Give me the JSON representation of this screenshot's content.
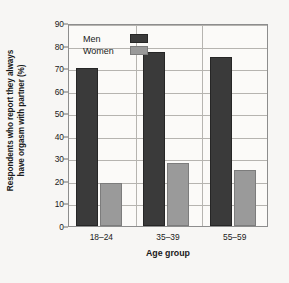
{
  "chart_data": {
    "type": "bar",
    "title": "",
    "subtitle": "",
    "xlabel": "Age group",
    "ylabel_line1": "Respondents who report they always",
    "ylabel_line2": "have orgasm with partner (%)",
    "ylabel": "Respondents who report they always have orgasm with partner (%)",
    "categories": [
      "18–24",
      "35–39",
      "55–59"
    ],
    "series": [
      {
        "name": "Men",
        "values": [
          70,
          77,
          75
        ],
        "color": "#3a3a3a"
      },
      {
        "name": "Women",
        "values": [
          19,
          28,
          25
        ],
        "color": "#9a9a9a"
      }
    ],
    "ylim": [
      0,
      90
    ],
    "ytick_step": 10,
    "yticks": [
      "0",
      "10",
      "20",
      "30",
      "40",
      "50",
      "60",
      "70",
      "80",
      "90"
    ],
    "grid": "horizontal-and-category-separators",
    "legend_position": "top-left-inside-plot",
    "legend_entries": [
      "Men",
      "Women"
    ],
    "background_color": "#f7f6f4",
    "plot_background_color": "#fbfaf8",
    "grid_color": "#b6b4b0",
    "axis_color": "#8d8d8d"
  }
}
